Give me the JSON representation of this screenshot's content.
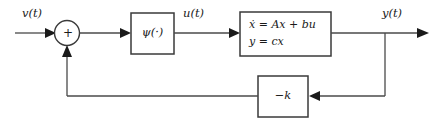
{
  "diagram": {
    "type": "control-system-block-diagram",
    "background_color": "#ffffff",
    "line_color": "#4a4a4a",
    "block_border_color": "#3a3a3a",
    "text_color": "#1a1a1a"
  },
  "signals": {
    "input_label": "v(t)",
    "control_label": "u(t)",
    "output_label": "y(t)"
  },
  "summing_junction": {
    "name": "summing-junction",
    "sign_label": "+",
    "cx": 67,
    "cy": 33,
    "r": 12.5
  },
  "blocks": [
    {
      "id": "nonlinearity",
      "name": "psi-block",
      "label": "ψ(·)",
      "label_main": "ψ",
      "label_arg": "(·)",
      "x": 131,
      "y": 13,
      "w": 43,
      "h": 41
    },
    {
      "id": "plant",
      "name": "state-space-block",
      "line1": "ẋ = Ax + bu",
      "line2": "y = cx",
      "x": 240,
      "y": 12,
      "w": 91,
      "h": 44
    },
    {
      "id": "gain",
      "name": "feedback-gain-block",
      "label": "−k",
      "x": 258,
      "y": 76,
      "w": 50,
      "h": 41
    }
  ],
  "wires": [
    {
      "name": "input-wire",
      "from": "v(t) source",
      "to": "summing-junction"
    },
    {
      "name": "sum-to-psi-wire",
      "from": "summing-junction",
      "to": "psi-block"
    },
    {
      "name": "psi-to-plant-wire",
      "from": "psi-block",
      "to": "state-space-block"
    },
    {
      "name": "plant-to-output-wire",
      "from": "state-space-block",
      "to": "y(t) output"
    },
    {
      "name": "output-tap-wire",
      "from": "y(t) tap",
      "to": "feedback-gain-block"
    },
    {
      "name": "gain-to-sum-wire",
      "from": "feedback-gain-block",
      "to": "summing-junction"
    }
  ]
}
